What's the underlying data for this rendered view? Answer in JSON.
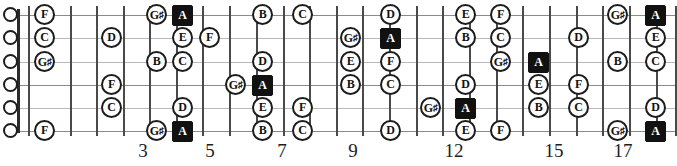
{
  "diagram": {
    "instrument": "guitar",
    "string_count": 6,
    "root_note": "A",
    "root_color": "#111111",
    "note_color": "#ffffff",
    "line_color": "#b9b9b9",
    "top_caption": ""
  },
  "strings": [
    {
      "index": 1,
      "name": "E",
      "y": 15
    },
    {
      "index": 2,
      "name": "B",
      "y": 38
    },
    {
      "index": 3,
      "name": "G",
      "y": 62
    },
    {
      "index": 4,
      "name": "D",
      "y": 85
    },
    {
      "index": 5,
      "name": "A",
      "y": 108
    },
    {
      "index": 6,
      "name": "E",
      "y": 131
    }
  ],
  "fret_lines_x": [
    28,
    70,
    96,
    123,
    149,
    176,
    202,
    229,
    256,
    283,
    309,
    336,
    362,
    389,
    416,
    442,
    469,
    496,
    522,
    549,
    576,
    602,
    629,
    656,
    675
  ],
  "fret_markers": [
    {
      "label": "3",
      "x": 252
    },
    {
      "label": "5",
      "x": 423
    },
    {
      "label": "7",
      "x": 595
    },
    {
      "label": "9",
      "x": 765
    },
    {
      "label": "12",
      "x": 1030
    },
    {
      "label": "15",
      "x": 1295
    },
    {
      "label": "17",
      "x": 1470
    }
  ],
  "fret_numbers": [
    {
      "label": "3",
      "x": 128
    },
    {
      "label": "5",
      "x": 195
    },
    {
      "label": "7",
      "x": 267
    },
    {
      "label": "9",
      "x": 338
    },
    {
      "label": "12",
      "x": 439
    },
    {
      "label": "15",
      "x": 539
    },
    {
      "label": "17",
      "x": 608
    }
  ],
  "open_strings": [
    {
      "string": 1,
      "x": 3,
      "y": 7
    },
    {
      "string": 2,
      "x": 3,
      "y": 30
    },
    {
      "string": 3,
      "x": 3,
      "y": 54
    },
    {
      "string": 4,
      "x": 3,
      "y": 77
    },
    {
      "string": 5,
      "x": 3,
      "y": 100
    },
    {
      "string": 6,
      "x": 3,
      "y": 123
    }
  ],
  "notes": [
    {
      "label": "F",
      "sharp": false,
      "root": false,
      "x": 34,
      "y": 4,
      "string": 1,
      "fret": 1
    },
    {
      "label": "C",
      "sharp": false,
      "root": false,
      "x": 34,
      "y": 27,
      "string": 2,
      "fret": 1
    },
    {
      "label": "G",
      "sharp": true,
      "root": false,
      "x": 34,
      "y": 51,
      "string": 3,
      "fret": 1
    },
    {
      "label": "F",
      "sharp": false,
      "root": false,
      "x": 34,
      "y": 120,
      "string": 6,
      "fret": 1
    },
    {
      "label": "D",
      "sharp": false,
      "root": false,
      "x": 101,
      "y": 27,
      "string": 2,
      "fret": 3
    },
    {
      "label": "F",
      "sharp": false,
      "root": false,
      "x": 101,
      "y": 74,
      "string": 4,
      "fret": 3
    },
    {
      "label": "C",
      "sharp": false,
      "root": false,
      "x": 101,
      "y": 97,
      "string": 5,
      "fret": 3
    },
    {
      "label": "G",
      "sharp": true,
      "root": false,
      "x": 146,
      "y": 4,
      "string": 1,
      "fret": 4
    },
    {
      "label": "B",
      "sharp": false,
      "root": false,
      "x": 146,
      "y": 51,
      "string": 3,
      "fret": 4
    },
    {
      "label": "G",
      "sharp": true,
      "root": false,
      "x": 146,
      "y": 120,
      "string": 6,
      "fret": 4
    },
    {
      "label": "A",
      "sharp": false,
      "root": true,
      "x": 172,
      "y": 5,
      "string": 1,
      "fret": 5
    },
    {
      "label": "E",
      "sharp": false,
      "root": false,
      "x": 172,
      "y": 27,
      "string": 2,
      "fret": 5
    },
    {
      "label": "C",
      "sharp": false,
      "root": false,
      "x": 172,
      "y": 51,
      "string": 3,
      "fret": 5
    },
    {
      "label": "D",
      "sharp": false,
      "root": false,
      "x": 172,
      "y": 97,
      "string": 5,
      "fret": 5
    },
    {
      "label": "A",
      "sharp": false,
      "root": true,
      "x": 172,
      "y": 121,
      "string": 6,
      "fret": 5
    },
    {
      "label": "F",
      "sharp": false,
      "root": false,
      "x": 199,
      "y": 27,
      "string": 2,
      "fret": 6
    },
    {
      "label": "G",
      "sharp": true,
      "root": false,
      "x": 225,
      "y": 74,
      "string": 4,
      "fret": 7
    },
    {
      "label": "B",
      "sharp": false,
      "root": false,
      "x": 252,
      "y": 4,
      "string": 1,
      "fret": 7
    },
    {
      "label": "D",
      "sharp": false,
      "root": false,
      "x": 252,
      "y": 51,
      "string": 3,
      "fret": 7
    },
    {
      "label": "A",
      "sharp": false,
      "root": true,
      "x": 252,
      "y": 75,
      "string": 4,
      "fret": 7
    },
    {
      "label": "E",
      "sharp": false,
      "root": false,
      "x": 252,
      "y": 97,
      "string": 5,
      "fret": 7
    },
    {
      "label": "B",
      "sharp": false,
      "root": false,
      "x": 252,
      "y": 120,
      "string": 6,
      "fret": 7
    },
    {
      "label": "C",
      "sharp": false,
      "root": false,
      "x": 292,
      "y": 4,
      "string": 1,
      "fret": 8
    },
    {
      "label": "F",
      "sharp": false,
      "root": false,
      "x": 292,
      "y": 97,
      "string": 5,
      "fret": 8
    },
    {
      "label": "C",
      "sharp": false,
      "root": false,
      "x": 292,
      "y": 120,
      "string": 6,
      "fret": 8
    },
    {
      "label": "G",
      "sharp": true,
      "root": false,
      "x": 340,
      "y": 27,
      "string": 2,
      "fret": 9
    },
    {
      "label": "E",
      "sharp": false,
      "root": false,
      "x": 340,
      "y": 51,
      "string": 3,
      "fret": 9
    },
    {
      "label": "B",
      "sharp": false,
      "root": false,
      "x": 340,
      "y": 74,
      "string": 4,
      "fret": 9
    },
    {
      "label": "D",
      "sharp": false,
      "root": false,
      "x": 380,
      "y": 4,
      "string": 1,
      "fret": 10
    },
    {
      "label": "A",
      "sharp": false,
      "root": true,
      "x": 380,
      "y": 28,
      "string": 2,
      "fret": 10
    },
    {
      "label": "F",
      "sharp": false,
      "root": false,
      "x": 380,
      "y": 51,
      "string": 3,
      "fret": 10
    },
    {
      "label": "C",
      "sharp": false,
      "root": false,
      "x": 380,
      "y": 74,
      "string": 4,
      "fret": 10
    },
    {
      "label": "D",
      "sharp": false,
      "root": false,
      "x": 380,
      "y": 120,
      "string": 6,
      "fret": 10
    },
    {
      "label": "G",
      "sharp": true,
      "root": false,
      "x": 420,
      "y": 97,
      "string": 5,
      "fret": 11
    },
    {
      "label": "E",
      "sharp": false,
      "root": false,
      "x": 455,
      "y": 4,
      "string": 1,
      "fret": 12
    },
    {
      "label": "B",
      "sharp": false,
      "root": false,
      "x": 455,
      "y": 27,
      "string": 2,
      "fret": 12
    },
    {
      "label": "D",
      "sharp": false,
      "root": false,
      "x": 455,
      "y": 74,
      "string": 4,
      "fret": 12
    },
    {
      "label": "A",
      "sharp": false,
      "root": true,
      "x": 455,
      "y": 98,
      "string": 5,
      "fret": 12
    },
    {
      "label": "E",
      "sharp": false,
      "root": false,
      "x": 455,
      "y": 120,
      "string": 6,
      "fret": 12
    },
    {
      "label": "F",
      "sharp": false,
      "root": false,
      "x": 490,
      "y": 4,
      "string": 1,
      "fret": 13
    },
    {
      "label": "C",
      "sharp": false,
      "root": false,
      "x": 490,
      "y": 27,
      "string": 2,
      "fret": 13
    },
    {
      "label": "G",
      "sharp": true,
      "root": false,
      "x": 490,
      "y": 51,
      "string": 3,
      "fret": 13
    },
    {
      "label": "F",
      "sharp": false,
      "root": false,
      "x": 490,
      "y": 120,
      "string": 6,
      "fret": 13
    },
    {
      "label": "A",
      "sharp": false,
      "root": true,
      "x": 528,
      "y": 52,
      "string": 3,
      "fret": 14
    },
    {
      "label": "E",
      "sharp": false,
      "root": false,
      "x": 528,
      "y": 74,
      "string": 4,
      "fret": 14
    },
    {
      "label": "B",
      "sharp": false,
      "root": false,
      "x": 528,
      "y": 97,
      "string": 5,
      "fret": 14
    },
    {
      "label": "D",
      "sharp": false,
      "root": false,
      "x": 568,
      "y": 27,
      "string": 2,
      "fret": 15
    },
    {
      "label": "F",
      "sharp": false,
      "root": false,
      "x": 568,
      "y": 74,
      "string": 4,
      "fret": 15
    },
    {
      "label": "C",
      "sharp": false,
      "root": false,
      "x": 568,
      "y": 97,
      "string": 5,
      "fret": 15
    },
    {
      "label": "G",
      "sharp": true,
      "root": false,
      "x": 607,
      "y": 4,
      "string": 1,
      "fret": 16
    },
    {
      "label": "B",
      "sharp": false,
      "root": false,
      "x": 607,
      "y": 51,
      "string": 3,
      "fret": 16
    },
    {
      "label": "G",
      "sharp": true,
      "root": false,
      "x": 607,
      "y": 120,
      "string": 6,
      "fret": 16
    },
    {
      "label": "A",
      "sharp": false,
      "root": true,
      "x": 645,
      "y": 5,
      "string": 1,
      "fret": 17
    },
    {
      "label": "E",
      "sharp": false,
      "root": false,
      "x": 645,
      "y": 27,
      "string": 2,
      "fret": 17
    },
    {
      "label": "C",
      "sharp": false,
      "root": false,
      "x": 645,
      "y": 51,
      "string": 3,
      "fret": 17
    },
    {
      "label": "D",
      "sharp": false,
      "root": false,
      "x": 645,
      "y": 97,
      "string": 5,
      "fret": 17
    },
    {
      "label": "A",
      "sharp": false,
      "root": true,
      "x": 645,
      "y": 121,
      "string": 6,
      "fret": 17
    }
  ]
}
